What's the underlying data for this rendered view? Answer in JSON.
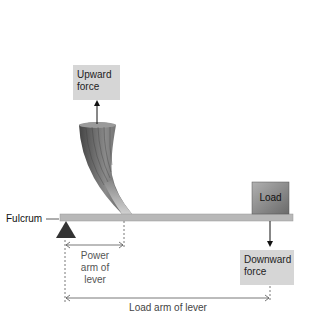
{
  "diagram": {
    "labels": {
      "upward_force": [
        "Upward",
        "force"
      ],
      "downward_force": [
        "Downward",
        "force"
      ],
      "load": "Load",
      "fulcrum": "Fulcrum",
      "power_arm": [
        "Power",
        "arm of",
        "lever"
      ],
      "load_arm": "Load arm of lever"
    },
    "colors": {
      "label_box": "#d6d6d6",
      "lever_bar": "#b8b8b8",
      "fulcrum": "#333333",
      "load_box": "#8a8a8a",
      "muscle": "#6e6e6e"
    }
  }
}
